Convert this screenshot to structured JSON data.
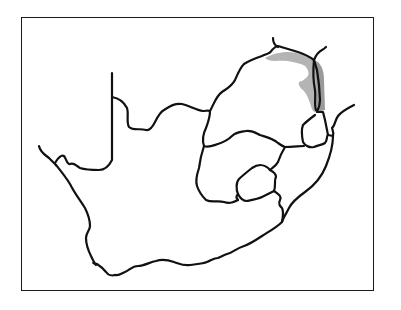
{
  "map": {
    "region": "South Africa",
    "type": "species distribution range map",
    "colors": {
      "border": "#111111",
      "range_fill": "#b4b4b4",
      "range_fill_dark": "#9a9a9a",
      "background": "#ffffff",
      "frame": "#1a1a1a"
    },
    "highlighted_range": "northeastern South Africa (Limpopo / Kruger region along Mozambique border)",
    "labels": []
  }
}
